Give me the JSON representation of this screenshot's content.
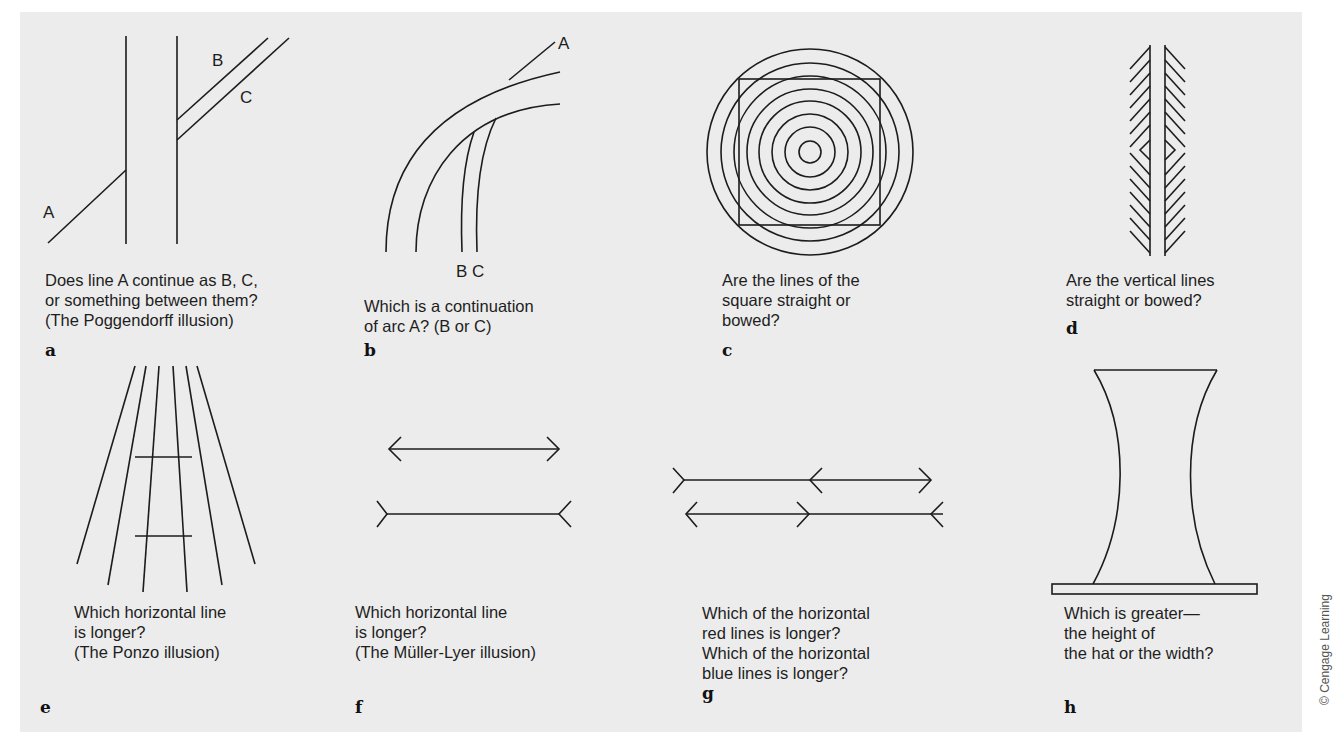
{
  "figure": {
    "credit": "© Cengage Learning",
    "panels": [
      {
        "letter": "a",
        "caption": "Does line A continue as B, C,\nor something between them?\n(The Poggendorff illusion)",
        "labels": [
          "A",
          "B",
          "C"
        ],
        "illusion": "Poggendorff"
      },
      {
        "letter": "b",
        "caption": "Which is a continuation\nof arc A? (B or C)",
        "labels": [
          "A",
          "B",
          "C"
        ]
      },
      {
        "letter": "c",
        "caption": "Are the lines of the\nsquare straight or\nbowed?"
      },
      {
        "letter": "d",
        "caption": "Are the vertical lines\nstraight or bowed?"
      },
      {
        "letter": "e",
        "caption": "Which horizontal line\nis longer?\n(The Ponzo illusion)",
        "illusion": "Ponzo"
      },
      {
        "letter": "f",
        "caption": "Which horizontal line\nis longer?\n(The Müller-Lyer illusion)",
        "illusion": "Müller-Lyer"
      },
      {
        "letter": "g",
        "caption": "Which of the horizontal\nred lines is longer?\nWhich of the horizontal\nblue lines is longer?"
      },
      {
        "letter": "h",
        "caption": "Which is greater—\nthe height of\nthe hat or the width?"
      }
    ]
  }
}
